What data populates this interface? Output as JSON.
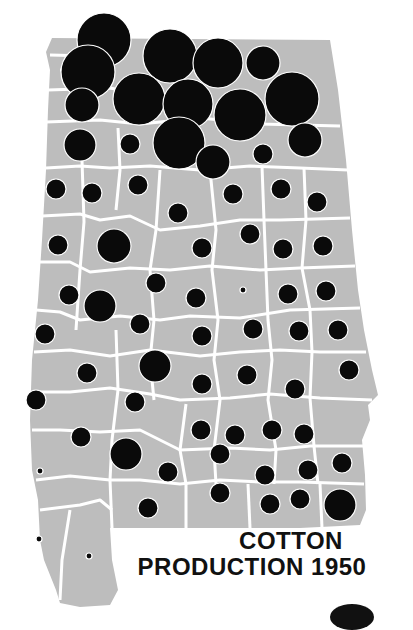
{
  "title": {
    "line1": "COTTON",
    "line2": "PRODUCTION 1950"
  },
  "colors": {
    "state_fill": "#bdbdbd",
    "county_border": "#ffffff",
    "symbol": "#0a0a0a",
    "background": "#ffffff"
  },
  "map": {
    "region": "Alabama",
    "subject": "Cotton production by county",
    "year": 1950,
    "symbol_type": "proportional circles",
    "symbols": [
      {
        "x": 104,
        "y": 40,
        "r": 27
      },
      {
        "x": 88,
        "y": 72,
        "r": 27
      },
      {
        "x": 82,
        "y": 105,
        "r": 17
      },
      {
        "x": 170,
        "y": 56,
        "r": 27
      },
      {
        "x": 218,
        "y": 63,
        "r": 25
      },
      {
        "x": 263,
        "y": 63,
        "r": 17
      },
      {
        "x": 139,
        "y": 99,
        "r": 26
      },
      {
        "x": 188,
        "y": 104,
        "r": 25
      },
      {
        "x": 240,
        "y": 115,
        "r": 26
      },
      {
        "x": 292,
        "y": 99,
        "r": 27
      },
      {
        "x": 179,
        "y": 143,
        "r": 26
      },
      {
        "x": 213,
        "y": 162,
        "r": 17
      },
      {
        "x": 305,
        "y": 140,
        "r": 17
      },
      {
        "x": 80,
        "y": 145,
        "r": 16
      },
      {
        "x": 130,
        "y": 144,
        "r": 10
      },
      {
        "x": 263,
        "y": 154,
        "r": 10
      },
      {
        "x": 56,
        "y": 189,
        "r": 10
      },
      {
        "x": 92,
        "y": 193,
        "r": 10
      },
      {
        "x": 138,
        "y": 185,
        "r": 10
      },
      {
        "x": 178,
        "y": 213,
        "r": 10
      },
      {
        "x": 233,
        "y": 194,
        "r": 10
      },
      {
        "x": 281,
        "y": 189,
        "r": 10
      },
      {
        "x": 317,
        "y": 202,
        "r": 10
      },
      {
        "x": 58,
        "y": 245,
        "r": 10
      },
      {
        "x": 114,
        "y": 246,
        "r": 17
      },
      {
        "x": 202,
        "y": 248,
        "r": 10
      },
      {
        "x": 250,
        "y": 234,
        "r": 10
      },
      {
        "x": 283,
        "y": 249,
        "r": 10
      },
      {
        "x": 323,
        "y": 246,
        "r": 10
      },
      {
        "x": 69,
        "y": 295,
        "r": 10
      },
      {
        "x": 100,
        "y": 306,
        "r": 16
      },
      {
        "x": 156,
        "y": 283,
        "r": 10
      },
      {
        "x": 196,
        "y": 298,
        "r": 10
      },
      {
        "x": 243,
        "y": 290,
        "r": 3
      },
      {
        "x": 288,
        "y": 294,
        "r": 10
      },
      {
        "x": 326,
        "y": 291,
        "r": 10
      },
      {
        "x": 45,
        "y": 334,
        "r": 10
      },
      {
        "x": 140,
        "y": 324,
        "r": 10
      },
      {
        "x": 202,
        "y": 336,
        "r": 10
      },
      {
        "x": 253,
        "y": 329,
        "r": 10
      },
      {
        "x": 299,
        "y": 331,
        "r": 10
      },
      {
        "x": 338,
        "y": 330,
        "r": 10
      },
      {
        "x": 87,
        "y": 373,
        "r": 10
      },
      {
        "x": 155,
        "y": 366,
        "r": 16
      },
      {
        "x": 202,
        "y": 384,
        "r": 10
      },
      {
        "x": 247,
        "y": 375,
        "r": 10
      },
      {
        "x": 295,
        "y": 389,
        "r": 10
      },
      {
        "x": 349,
        "y": 370,
        "r": 10
      },
      {
        "x": 36,
        "y": 400,
        "r": 10
      },
      {
        "x": 135,
        "y": 402,
        "r": 10
      },
      {
        "x": 201,
        "y": 430,
        "r": 10
      },
      {
        "x": 235,
        "y": 435,
        "r": 10
      },
      {
        "x": 272,
        "y": 430,
        "r": 10
      },
      {
        "x": 304,
        "y": 434,
        "r": 10
      },
      {
        "x": 342,
        "y": 463,
        "r": 10
      },
      {
        "x": 81,
        "y": 437,
        "r": 10
      },
      {
        "x": 126,
        "y": 454,
        "r": 16
      },
      {
        "x": 168,
        "y": 472,
        "r": 10
      },
      {
        "x": 220,
        "y": 454,
        "r": 10
      },
      {
        "x": 265,
        "y": 475,
        "r": 10
      },
      {
        "x": 308,
        "y": 470,
        "r": 10
      },
      {
        "x": 40,
        "y": 471,
        "r": 3
      },
      {
        "x": 148,
        "y": 508,
        "r": 10
      },
      {
        "x": 220,
        "y": 493,
        "r": 10
      },
      {
        "x": 270,
        "y": 504,
        "r": 10
      },
      {
        "x": 300,
        "y": 499,
        "r": 10
      },
      {
        "x": 340,
        "y": 505,
        "r": 16
      },
      {
        "x": 39,
        "y": 539,
        "r": 3
      },
      {
        "x": 89,
        "y": 556,
        "r": 3
      }
    ]
  }
}
